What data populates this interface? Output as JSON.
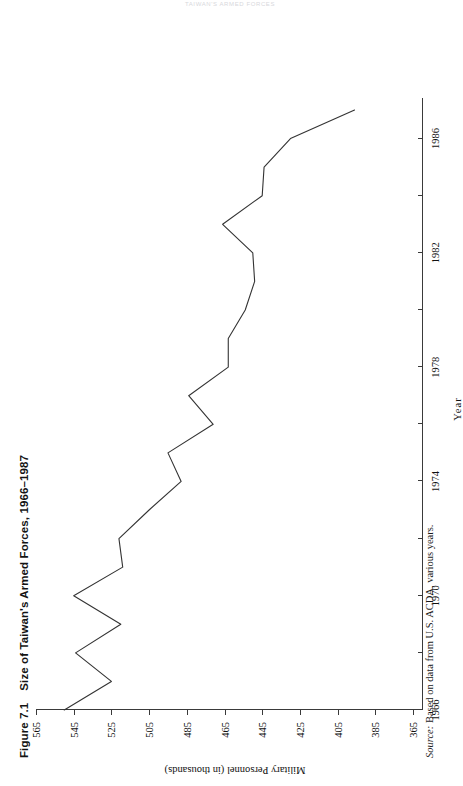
{
  "running_head": "TAIWAN'S ARMED FORCES",
  "figure": {
    "number": "Figure 7.1",
    "title": "Size of Taiwan's Armed Forces, 1966–1987",
    "source_prefix": "Source:",
    "source_text": " Based on data from U.S. ACDA, various years."
  },
  "chart_data": {
    "type": "line",
    "title": "Size of Taiwan's Armed Forces, 1966–1987",
    "xlabel": "Year",
    "ylabel": "Military Personnel (in thousands)",
    "xlim": [
      1966,
      1987
    ],
    "ylim": [
      365,
      565
    ],
    "grid": false,
    "legend": null,
    "xticks": [
      1966,
      1970,
      1974,
      1978,
      1982,
      1986
    ],
    "xtick_minor": [
      1968,
      1972,
      1976,
      1980,
      1984
    ],
    "yticks": [
      365,
      385,
      405,
      425,
      445,
      465,
      485,
      505,
      525,
      545,
      565
    ],
    "x": [
      1966,
      1967,
      1968,
      1969,
      1970,
      1971,
      1972,
      1973,
      1974,
      1975,
      1976,
      1977,
      1978,
      1979,
      1980,
      1981,
      1982,
      1983,
      1984,
      1985,
      1986,
      1987
    ],
    "values": [
      550,
      525,
      544,
      520,
      545,
      519,
      521,
      505,
      488,
      495,
      471,
      484,
      463,
      463,
      454,
      449,
      450,
      466,
      445,
      444,
      430,
      396
    ],
    "series": [
      {
        "name": "Military Personnel (in thousands)",
        "color": "#333333",
        "values": [
          550,
          525,
          544,
          520,
          545,
          519,
          521,
          505,
          488,
          495,
          471,
          484,
          463,
          463,
          454,
          449,
          450,
          466,
          445,
          444,
          430,
          396
        ]
      }
    ]
  }
}
